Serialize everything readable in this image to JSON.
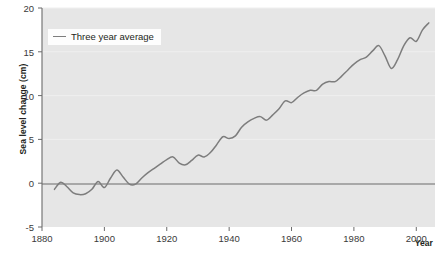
{
  "chart_data": {
    "type": "line",
    "title": "",
    "xlabel": "Year",
    "ylabel": "Sea level change (cm)",
    "xlim": [
      1880,
      2006
    ],
    "ylim": [
      -5,
      20
    ],
    "grid": false,
    "legend_position": "top-left",
    "x_ticks": [
      1880,
      1900,
      1920,
      1940,
      1960,
      1980,
      2000
    ],
    "x_tick_labels": [
      "1880",
      "1900",
      "1920",
      "1940",
      "1960",
      "1980",
      "2000"
    ],
    "y_ticks": [
      -5,
      0,
      5,
      10,
      15,
      20
    ],
    "y_tick_labels": [
      "-5",
      "0",
      "5",
      "10",
      "15",
      "20"
    ],
    "series": [
      {
        "name": "Three year average",
        "color": "#7d7d7d",
        "x": [
          1884,
          1886,
          1888,
          1890,
          1892,
          1894,
          1896,
          1898,
          1900,
          1902,
          1904,
          1906,
          1908,
          1910,
          1912,
          1914,
          1916,
          1918,
          1920,
          1922,
          1924,
          1926,
          1928,
          1930,
          1932,
          1934,
          1936,
          1938,
          1940,
          1942,
          1944,
          1946,
          1948,
          1950,
          1952,
          1954,
          1956,
          1958,
          1960,
          1962,
          1964,
          1966,
          1968,
          1970,
          1972,
          1974,
          1976,
          1978,
          1980,
          1982,
          1984,
          1986,
          1988,
          1990,
          1992,
          1994,
          1996,
          1998,
          2000,
          2002,
          2004
        ],
        "y": [
          -0.7,
          0.1,
          -0.4,
          -1.1,
          -1.3,
          -1.2,
          -0.7,
          0.2,
          -0.5,
          0.6,
          1.5,
          0.7,
          -0.1,
          -0.1,
          0.6,
          1.2,
          1.7,
          2.2,
          2.7,
          3.0,
          2.3,
          2.1,
          2.6,
          3.2,
          3.0,
          3.5,
          4.4,
          5.3,
          5.1,
          5.4,
          6.4,
          7.0,
          7.4,
          7.6,
          7.2,
          7.8,
          8.5,
          9.4,
          9.2,
          9.8,
          10.3,
          10.6,
          10.6,
          11.3,
          11.6,
          11.6,
          12.2,
          12.9,
          13.6,
          14.1,
          14.4,
          15.1,
          15.7,
          14.5,
          13.1,
          14.1,
          15.7,
          16.6,
          16.2,
          17.5,
          18.3
        ]
      }
    ]
  },
  "legend": {
    "label": "Three year average"
  },
  "axes": {
    "y_title": "Sea level change (cm)",
    "x_title": "Year"
  },
  "colors": {
    "line": "#7d7d7d",
    "plot_background": "#e6e6e6",
    "axis": "#6b6b6b",
    "zero_line": "#6b6b6b",
    "text": "#231f20"
  }
}
